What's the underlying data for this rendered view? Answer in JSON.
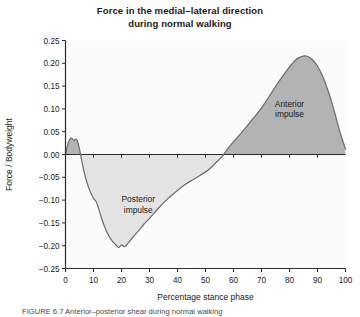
{
  "figure": {
    "title_line1": "Force in the medial–lateral direction",
    "title_line2": "during normal walking",
    "caption": "FIGURE 6.7  Anterior–posterior shear during normal walking"
  },
  "colors": {
    "anterior_fill": "#b3b3b3",
    "posterior_fill": "#e3e3e3",
    "curve": "#6e6e6e",
    "axis": "#2b2b2b",
    "text": "#1a1a1a",
    "background": "#ffffff"
  },
  "annotations": {
    "anterior_l1": "Anterior",
    "anterior_l2": "impulse",
    "posterior_l1": "Posterior",
    "posterior_l2": "impulse"
  },
  "chart_data": {
    "type": "area",
    "title": "Force in the medial–lateral direction during normal walking",
    "xlabel": "Percentage stance phase",
    "ylabel": "Force / Bodyweight",
    "xlim": [
      0,
      100
    ],
    "ylim": [
      -0.25,
      0.25
    ],
    "xticks": [
      0,
      10,
      20,
      30,
      40,
      50,
      60,
      70,
      80,
      90,
      100
    ],
    "yticks": [
      -0.25,
      -0.2,
      -0.15,
      -0.1,
      -0.05,
      0.0,
      0.05,
      0.1,
      0.15,
      0.2,
      0.25
    ],
    "xticklabels": [
      "0",
      "10",
      "20",
      "30",
      "40",
      "50",
      "60",
      "70",
      "80",
      "90",
      "100"
    ],
    "yticklabels": [
      "-0.25",
      "-0.20",
      "-0.15",
      "-0.10",
      "-0.05",
      "0.00",
      "0.05",
      "0.10",
      "0.15",
      "0.20",
      "0.25"
    ],
    "grid": false,
    "legend": null,
    "zero_line": 0.0,
    "series": [
      {
        "name": "Anterior-posterior shear force",
        "x": [
          0,
          1,
          2,
          3,
          4,
          5,
          6,
          7,
          8,
          9,
          10,
          11,
          12,
          13,
          14,
          15,
          16,
          17,
          18,
          19,
          20,
          21,
          22,
          24,
          26,
          28,
          30,
          33,
          36,
          39,
          42,
          45,
          48,
          51,
          54,
          56,
          58,
          61,
          64,
          67,
          70,
          73,
          76,
          79,
          82,
          84,
          86,
          88,
          90,
          92,
          94,
          96,
          98,
          100
        ],
        "y": [
          0.0,
          0.026,
          0.036,
          0.031,
          0.033,
          0.012,
          -0.02,
          -0.047,
          -0.068,
          -0.084,
          -0.096,
          -0.104,
          -0.122,
          -0.142,
          -0.159,
          -0.173,
          -0.184,
          -0.192,
          -0.198,
          -0.204,
          -0.198,
          -0.202,
          -0.197,
          -0.182,
          -0.168,
          -0.153,
          -0.14,
          -0.119,
          -0.1,
          -0.084,
          -0.069,
          -0.057,
          -0.046,
          -0.034,
          -0.016,
          -0.004,
          0.013,
          0.035,
          0.056,
          0.079,
          0.102,
          0.13,
          0.158,
          0.184,
          0.206,
          0.214,
          0.216,
          0.209,
          0.194,
          0.169,
          0.136,
          0.095,
          0.05,
          0.012
        ]
      }
    ],
    "annotations": [
      {
        "text": "Anterior impulse",
        "x": 80,
        "y": 0.105
      },
      {
        "text": "Posterior impulse",
        "x": 26,
        "y": -0.105
      }
    ],
    "peaks": {
      "initial_bump_max": 0.036,
      "posterior_min": -0.204,
      "anterior_max": 0.216,
      "zero_cross_1": 5.5,
      "zero_cross_2": 56.5
    }
  }
}
